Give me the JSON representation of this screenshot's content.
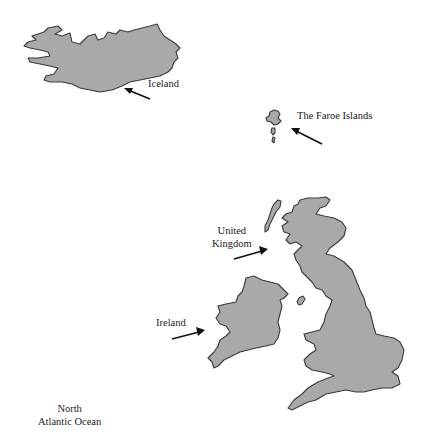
{
  "map": {
    "colors": {
      "land": "#a9a9a9",
      "outline": "#3a3a3a",
      "background": "#ffffff",
      "text": "#222222"
    },
    "labels": {
      "iceland": "Iceland",
      "faroe": "The Faroe Islands",
      "uk_line1": "United",
      "uk_line2": "Kingdom",
      "ireland": "Ireland",
      "ocean_line1": "North",
      "ocean_line2": "Atlantic Ocean"
    }
  }
}
